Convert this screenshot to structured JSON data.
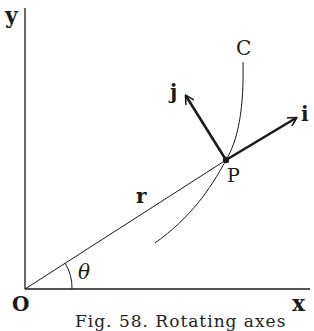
{
  "diagram": {
    "axes": {
      "x_label": "x",
      "y_label": "y",
      "origin_label": "O"
    },
    "curve_label": "C",
    "point_label": "P",
    "radius_label": "r",
    "angle_label": "θ",
    "unit_vectors": [
      {
        "label": "i",
        "direction": "tangent/outward along curve normal"
      },
      {
        "label": "j",
        "direction": "perpendicular to i"
      }
    ],
    "caption": "Fig. 58. Rotating axes"
  },
  "colors": {
    "ink": "#1a1a1a",
    "background": "#ffffff"
  }
}
